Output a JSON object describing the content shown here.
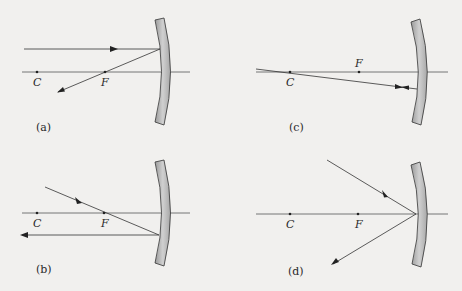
{
  "panels": [
    {
      "id": "a",
      "label": "(a)",
      "point_c": "C",
      "point_f": "F"
    },
    {
      "id": "b",
      "label": "(b)",
      "point_c": "C",
      "point_f": "F"
    },
    {
      "id": "c",
      "label": "(c)",
      "point_c": "C",
      "point_f": "F"
    },
    {
      "id": "d",
      "label": "(d)",
      "point_c": "C",
      "point_f": "F"
    }
  ],
  "colors": {
    "background": "#f1f0ee",
    "ray": "#3a3a3a",
    "mirror_fill": "#b8b8b8",
    "mirror_edge": "#3a3a3a"
  }
}
